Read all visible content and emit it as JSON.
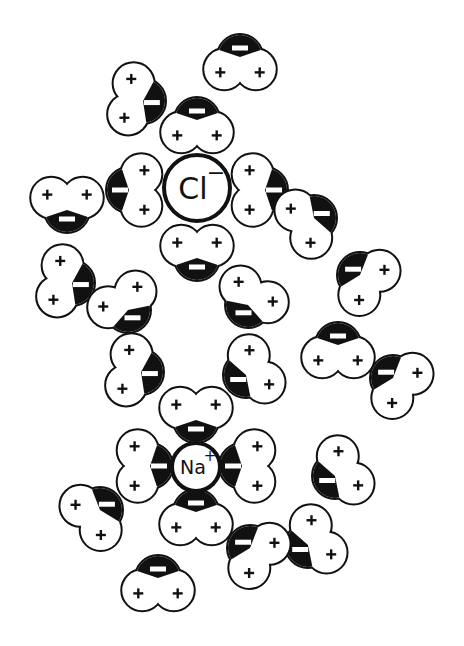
{
  "diagram": {
    "title": "Hydrated sodium and chloride ions in water",
    "colors": {
      "background": "#ffffff",
      "ink": "#111111",
      "oxygen_fill": "#111111",
      "hydrogen_fill": "#ffffff"
    },
    "ions": [
      {
        "id": "chloride",
        "symbol": "Cl",
        "charge": "−",
        "cx": 197,
        "cy": 188,
        "r": 33
      },
      {
        "id": "sodium",
        "symbol": "Na",
        "charge": "+",
        "cx": 196,
        "cy": 467,
        "r": 24
      }
    ],
    "charge_labels": {
      "hydrogen": "+",
      "oxygen": "−"
    },
    "water_molecules": [
      {
        "id": "w1",
        "ox": 240,
        "oy": 57,
        "dir": 90,
        "group": "free"
      },
      {
        "id": "w2",
        "ox": 143,
        "oy": 101,
        "dir": 190,
        "group": "free"
      },
      {
        "id": "w3",
        "ox": 197,
        "oy": 120,
        "dir": 90,
        "group": "chloride-shell"
      },
      {
        "id": "w4",
        "ox": 129,
        "oy": 190,
        "dir": 0,
        "group": "chloride-shell"
      },
      {
        "id": "w5",
        "ox": 265,
        "oy": 190,
        "dir": 180,
        "group": "chloride-shell"
      },
      {
        "id": "w6",
        "ox": 197,
        "oy": 258,
        "dir": 270,
        "group": "chloride-shell"
      },
      {
        "id": "w7",
        "ox": 67,
        "oy": 210,
        "dir": 270,
        "group": "free"
      },
      {
        "id": "w8",
        "ox": 72,
        "oy": 283,
        "dir": 190,
        "group": "free"
      },
      {
        "id": "w9",
        "ox": 128,
        "oy": 310,
        "dir": 240,
        "group": "free"
      },
      {
        "id": "w10",
        "ox": 248,
        "oy": 305,
        "dir": 300,
        "group": "free"
      },
      {
        "id": "w11",
        "ox": 314,
        "oy": 218,
        "dir": 150,
        "group": "free"
      },
      {
        "id": "w12",
        "ox": 360,
        "oy": 275,
        "dir": 40,
        "group": "free"
      },
      {
        "id": "w13",
        "ox": 338,
        "oy": 345,
        "dir": 90,
        "group": "free"
      },
      {
        "id": "w14",
        "ox": 393,
        "oy": 378,
        "dir": 40,
        "group": "free"
      },
      {
        "id": "w15",
        "ox": 141,
        "oy": 372,
        "dir": 190,
        "group": "free"
      },
      {
        "id": "w16",
        "ox": 246,
        "oy": 375,
        "dir": 330,
        "group": "free"
      },
      {
        "id": "w17",
        "ox": 196,
        "oy": 420,
        "dir": 270,
        "group": "sodium-shell"
      },
      {
        "id": "w18",
        "ox": 150,
        "oy": 466,
        "dir": 180,
        "group": "sodium-shell"
      },
      {
        "id": "w19",
        "ox": 242,
        "oy": 466,
        "dir": 0,
        "group": "sodium-shell"
      },
      {
        "id": "w20",
        "ox": 196,
        "oy": 512,
        "dir": 90,
        "group": "sodium-shell"
      },
      {
        "id": "w21",
        "ox": 100,
        "oy": 510,
        "dir": 140,
        "group": "free"
      },
      {
        "id": "w22",
        "ox": 335,
        "oy": 476,
        "dir": 330,
        "group": "free"
      },
      {
        "id": "w23",
        "ox": 308,
        "oy": 545,
        "dir": 330,
        "group": "free"
      },
      {
        "id": "w24",
        "ox": 250,
        "oy": 548,
        "dir": 40,
        "group": "free"
      },
      {
        "id": "w25",
        "ox": 158,
        "oy": 578,
        "dir": 90,
        "group": "free"
      }
    ]
  }
}
